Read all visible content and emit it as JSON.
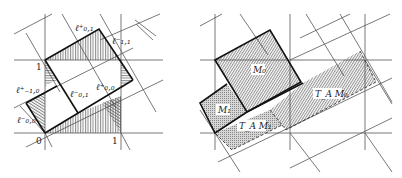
{
  "left_panel": {
    "labels": {
      "l_plus_0_1": "ℓ⁺₀,₁",
      "l_minus_1_1": "ℓ⁻₁,₁",
      "l_plus_m1_0": "ℓ⁺₋₁,₀",
      "l_minus_0_1": "ℓ⁻₀,₁",
      "l_plus_0_0": "ℓ⁺₀,₀",
      "l_minus_0_0": "ℓ⁻₀,₀"
    },
    "axis_ticks": {
      "origin": "0",
      "x_one": "1",
      "y_one": "1"
    }
  },
  "right_panel": {
    "labels": {
      "m0": "M₀",
      "m1": "M₁",
      "ta_m0": "T_A M₀",
      "ta_m1": "T_A M₁"
    }
  },
  "colors": {
    "line": "#111111",
    "grid": "#555555",
    "hatch": "#444444",
    "background": "#ffffff"
  }
}
